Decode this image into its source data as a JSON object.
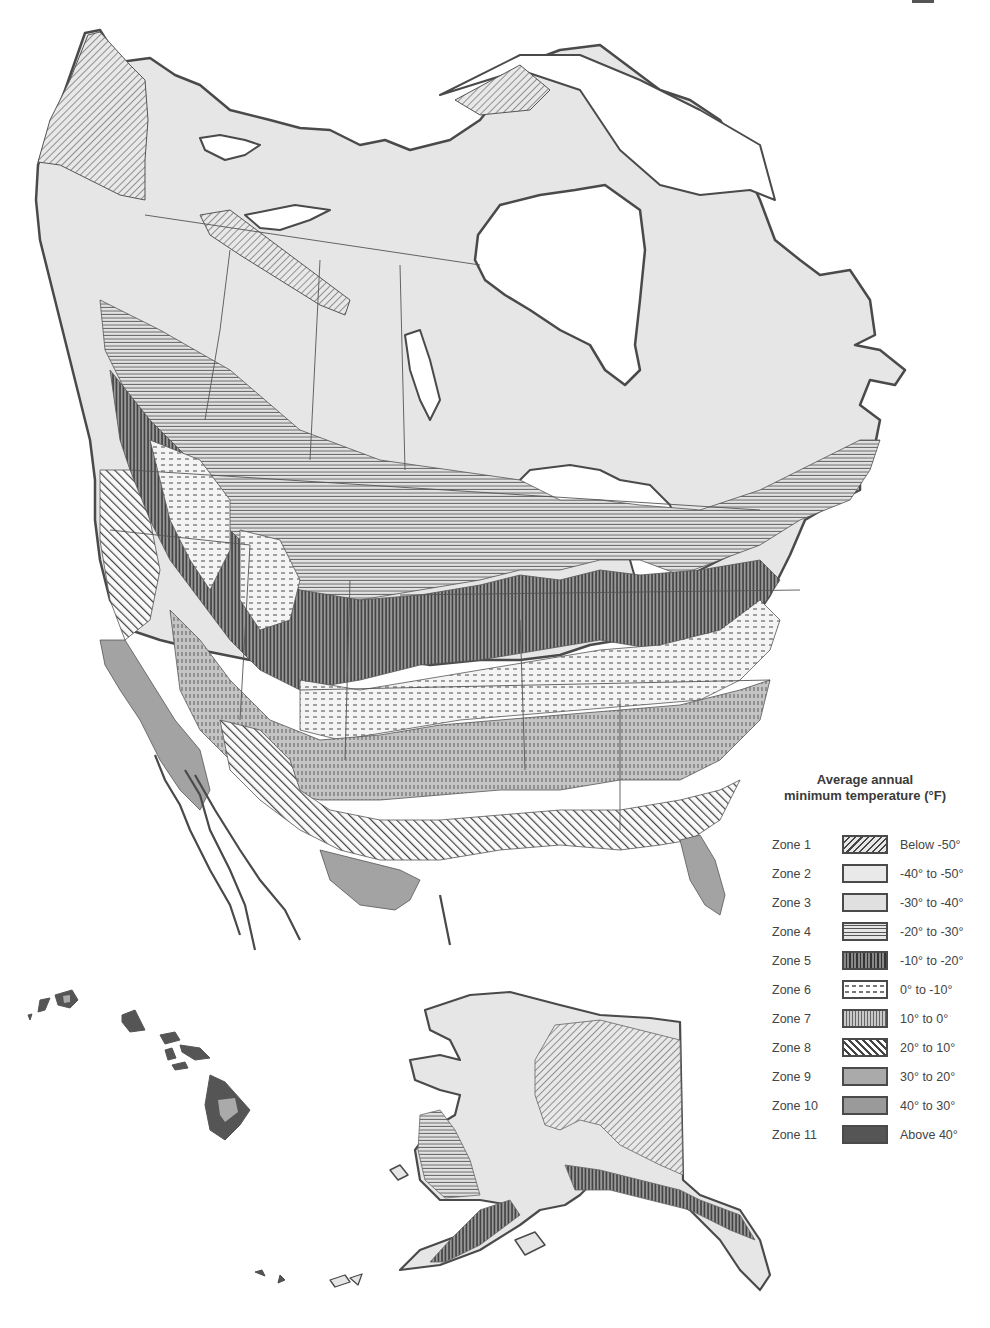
{
  "legend": {
    "title_line1": "Average annual",
    "title_line2": "minimum temperature (°F)",
    "zones": [
      {
        "zone": "Zone 1",
        "range": "Below -50°",
        "pattern": "diagonal-hatch-light"
      },
      {
        "zone": "Zone 2",
        "range": "-40° to -50°",
        "pattern": "light-gray-solid"
      },
      {
        "zone": "Zone 3",
        "range": "-30° to -40°",
        "pattern": "light-gray-solid"
      },
      {
        "zone": "Zone 4",
        "range": "-20° to -30°",
        "pattern": "horizontal-lines"
      },
      {
        "zone": "Zone 5",
        "range": "-10° to -20°",
        "pattern": "dense-vertical-lines"
      },
      {
        "zone": "Zone 6",
        "range": "0° to -10°",
        "pattern": "horizontal-dashes"
      },
      {
        "zone": "Zone 7",
        "range": "10° to 0°",
        "pattern": "vertical-dashes"
      },
      {
        "zone": "Zone 8",
        "range": "20° to 10°",
        "pattern": "diagonal-hatch-bold"
      },
      {
        "zone": "Zone 9",
        "range": "30° to 20°",
        "pattern": "medium-gray-solid"
      },
      {
        "zone": "Zone 10",
        "range": "40° to 30°",
        "pattern": "medium-gray-solid"
      },
      {
        "zone": "Zone 11",
        "range": "Above 40°",
        "pattern": "dark-gray-solid"
      }
    ]
  },
  "map": {
    "regions": [
      "North America mainland",
      "Hawaii inset",
      "Alaska inset"
    ],
    "colors": {
      "outline": "#4a4a4a",
      "zone2_3_fill": "#e6e6e6",
      "zone9_10_fill": "#a3a3a3",
      "zone11_fill": "#555555",
      "water": "#ffffff"
    }
  }
}
